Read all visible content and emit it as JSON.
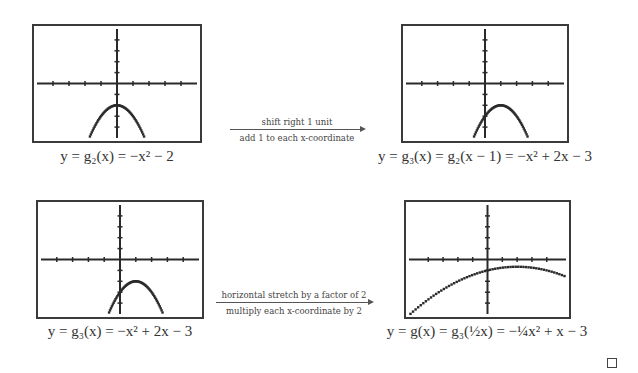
{
  "chart_data": [
    {
      "type": "line",
      "title": "",
      "caption": "y = g₂(x) = −x² − 2",
      "function": {
        "a": -1,
        "b": 0,
        "c": -2
      },
      "x_domain": [
        -1.75,
        1.75
      ],
      "xlim": [
        -5,
        5
      ],
      "ylim": [
        -5,
        5
      ],
      "x_ticks": [
        -4,
        -3,
        -2,
        -1,
        1,
        2,
        3,
        4
      ],
      "y_ticks": [
        -4,
        -3,
        -2,
        -1,
        1,
        2,
        3,
        4
      ],
      "grid": false
    },
    {
      "type": "line",
      "title": "",
      "caption": "y = g₃(x) = g₂(x − 1) = −x² + 2x − 3",
      "function": {
        "a": -1,
        "b": 2,
        "c": -3
      },
      "x_domain": [
        -0.75,
        2.75
      ],
      "xlim": [
        -5,
        5
      ],
      "ylim": [
        -5,
        5
      ],
      "x_ticks": [
        -4,
        -3,
        -2,
        -1,
        1,
        2,
        3,
        4
      ],
      "y_ticks": [
        -4,
        -3,
        -2,
        -1,
        1,
        2,
        3,
        4
      ],
      "grid": false
    },
    {
      "type": "line",
      "title": "",
      "caption": "y = g₃(x) = −x² + 2x − 3",
      "function": {
        "a": -1,
        "b": 2,
        "c": -3
      },
      "x_domain": [
        -0.75,
        2.75
      ],
      "xlim": [
        -5,
        5
      ],
      "ylim": [
        -5,
        5
      ],
      "x_ticks": [
        -4,
        -3,
        -2,
        -1,
        1,
        2,
        3,
        4
      ],
      "y_ticks": [
        -4,
        -3,
        -2,
        -1,
        1,
        2,
        3,
        4
      ],
      "grid": false
    },
    {
      "type": "line",
      "title": "",
      "caption": "y = g(x) = g₃(½x) = −¼x² + x − 3",
      "function": {
        "a": -0.25,
        "b": 1,
        "c": -3
      },
      "x_domain": [
        -5.2,
        5.2
      ],
      "xlim": [
        -5.3,
        5.3
      ],
      "ylim": [
        -15,
        15
      ],
      "x_ticks": [
        -4,
        -3,
        -2,
        -1,
        1,
        2,
        3,
        4
      ],
      "y_ticks": [
        -12,
        -9,
        -6,
        -3,
        3,
        6,
        9,
        12
      ],
      "grid": false
    }
  ],
  "transforms": [
    {
      "top": "shift right 1 unit",
      "bottom": "add 1 to each x-coordinate"
    },
    {
      "top": "horizontal stretch by a factor of 2",
      "bottom": "multiply each x-coordinate by 2"
    }
  ],
  "qed_symbol": "□",
  "colors": {
    "curve": "#2a2a2a",
    "axis": "#2a2a2a",
    "border": "#3a3a3a"
  }
}
